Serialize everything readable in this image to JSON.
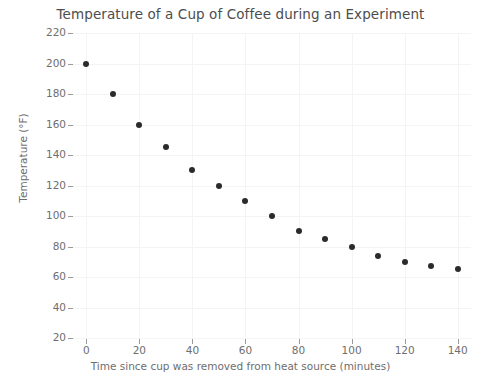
{
  "chart_data": {
    "type": "scatter",
    "title": "Temperature of a Cup of Coffee during an Experiment",
    "xlabel": "Time since cup was removed from heat source (minutes)",
    "ylabel": "Temperature (°F)",
    "x": [
      0,
      10,
      20,
      30,
      40,
      50,
      60,
      70,
      80,
      90,
      100,
      110,
      120,
      130,
      140
    ],
    "values": [
      200,
      180,
      160,
      145,
      130,
      120,
      110,
      100,
      90,
      85,
      80,
      74,
      70,
      67,
      65
    ],
    "series": [
      {
        "name": "Temperature",
        "values": [
          200,
          180,
          160,
          145,
          130,
          120,
          110,
          100,
          90,
          85,
          80,
          74,
          70,
          67,
          65
        ]
      }
    ],
    "xlim": [
      -5,
      145
    ],
    "ylim": [
      20,
      220
    ],
    "xticks": [
      0,
      20,
      40,
      60,
      80,
      100,
      120,
      140
    ],
    "yticks": [
      20,
      40,
      60,
      80,
      100,
      120,
      140,
      160,
      180,
      200,
      220
    ],
    "xtick_labels": [
      "0",
      "20",
      "40",
      "60",
      "80",
      "100",
      "120",
      "140"
    ],
    "ytick_labels": [
      "20",
      "40",
      "60",
      "80",
      "100",
      "120",
      "140",
      "160",
      "180",
      "200",
      "220"
    ],
    "grid": true,
    "legend": false,
    "marker_color": "#2b2b2b",
    "text_color": "#6e6e6e",
    "title_color": "#4d4d4d",
    "grid_color": "#f4f4f4",
    "background_color": "#ffffff"
  }
}
